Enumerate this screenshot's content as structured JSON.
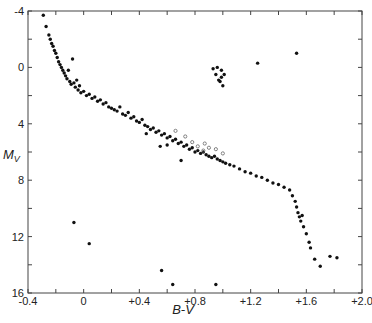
{
  "chart_data": {
    "type": "scatter",
    "title": "",
    "xlabel": "B-V",
    "ylabel": "M_V",
    "xlim": [
      -0.4,
      2.0
    ],
    "ylim": [
      16,
      -4
    ],
    "y_inverted": true,
    "grid": false,
    "legend": null,
    "x_ticks": [
      "-0.4",
      "0",
      "+0.4",
      "+0.8",
      "+1.2",
      "+1.6",
      "+2.0"
    ],
    "x_tick_values": [
      -0.4,
      0,
      0.4,
      0.8,
      1.2,
      1.6,
      2.0
    ],
    "y_ticks": [
      "-4",
      "0",
      "4",
      "8",
      "12",
      "16"
    ],
    "y_tick_values": [
      -4,
      0,
      4,
      8,
      12,
      16
    ],
    "series": [
      {
        "name": "main sequence and giants (filled)",
        "marker": "filled-circle",
        "points": [
          [
            -0.29,
            -3.7
          ],
          [
            -0.27,
            -2.9
          ],
          [
            -0.25,
            -2.3
          ],
          [
            -0.24,
            -2.0
          ],
          [
            -0.23,
            -1.7
          ],
          [
            -0.22,
            -1.5
          ],
          [
            -0.21,
            -1.2
          ],
          [
            -0.2,
            -1.0
          ],
          [
            -0.19,
            -0.7
          ],
          [
            -0.18,
            -0.4
          ],
          [
            -0.17,
            -0.2
          ],
          [
            -0.16,
            0.0
          ],
          [
            -0.15,
            0.2
          ],
          [
            -0.14,
            0.4
          ],
          [
            -0.13,
            0.6
          ],
          [
            -0.12,
            0.8
          ],
          [
            -0.11,
            0.2
          ],
          [
            -0.1,
            1.0
          ],
          [
            -0.09,
            1.2
          ],
          [
            -0.08,
            -0.6
          ],
          [
            -0.07,
            1.1
          ],
          [
            -0.06,
            1.4
          ],
          [
            -0.05,
            0.9
          ],
          [
            -0.04,
            1.6
          ],
          [
            -0.03,
            1.3
          ],
          [
            -0.02,
            1.8
          ],
          [
            0.0,
            1.7
          ],
          [
            0.02,
            2.0
          ],
          [
            0.04,
            1.9
          ],
          [
            0.06,
            2.2
          ],
          [
            0.08,
            2.1
          ],
          [
            0.1,
            2.4
          ],
          [
            0.12,
            2.3
          ],
          [
            0.14,
            2.6
          ],
          [
            0.16,
            2.5
          ],
          [
            0.18,
            2.8
          ],
          [
            0.2,
            2.9
          ],
          [
            0.22,
            3.0
          ],
          [
            0.24,
            3.1
          ],
          [
            0.26,
            2.8
          ],
          [
            0.28,
            3.3
          ],
          [
            0.3,
            3.4
          ],
          [
            0.32,
            3.2
          ],
          [
            0.34,
            3.6
          ],
          [
            0.36,
            3.5
          ],
          [
            0.38,
            3.8
          ],
          [
            0.4,
            3.9
          ],
          [
            0.42,
            3.7
          ],
          [
            0.44,
            4.1
          ],
          [
            0.46,
            4.2
          ],
          [
            0.48,
            4.4
          ],
          [
            0.5,
            4.3
          ],
          [
            0.52,
            4.6
          ],
          [
            0.54,
            4.5
          ],
          [
            0.56,
            4.8
          ],
          [
            0.58,
            4.7
          ],
          [
            0.6,
            5.0
          ],
          [
            0.62,
            4.9
          ],
          [
            0.64,
            5.2
          ],
          [
            0.66,
            5.1
          ],
          [
            0.68,
            5.4
          ],
          [
            0.7,
            5.3
          ],
          [
            0.72,
            5.6
          ],
          [
            0.74,
            5.5
          ],
          [
            0.76,
            5.8
          ],
          [
            0.78,
            5.7
          ],
          [
            0.8,
            6.0
          ],
          [
            0.82,
            5.9
          ],
          [
            0.84,
            6.1
          ],
          [
            0.86,
            6.0
          ],
          [
            0.88,
            6.2
          ],
          [
            0.9,
            6.3
          ],
          [
            0.92,
            6.4
          ],
          [
            0.94,
            6.3
          ],
          [
            0.96,
            6.5
          ],
          [
            0.98,
            6.6
          ],
          [
            1.0,
            6.7
          ],
          [
            1.02,
            6.8
          ],
          [
            1.05,
            6.9
          ],
          [
            1.08,
            7.0
          ],
          [
            1.12,
            7.2
          ],
          [
            1.16,
            7.4
          ],
          [
            1.2,
            7.5
          ],
          [
            1.24,
            7.7
          ],
          [
            1.28,
            7.8
          ],
          [
            1.32,
            8.0
          ],
          [
            1.36,
            8.2
          ],
          [
            1.4,
            8.3
          ],
          [
            1.44,
            8.5
          ],
          [
            1.48,
            8.7
          ],
          [
            1.5,
            9.1
          ],
          [
            1.52,
            9.5
          ],
          [
            1.53,
            9.9
          ],
          [
            1.54,
            10.3
          ],
          [
            1.55,
            10.6
          ],
          [
            1.56,
            10.9
          ],
          [
            1.57,
            10.5
          ],
          [
            1.58,
            11.3
          ],
          [
            1.6,
            11.8
          ],
          [
            1.62,
            12.4
          ],
          [
            1.63,
            12.8
          ],
          [
            1.66,
            13.6
          ],
          [
            1.7,
            14.1
          ],
          [
            1.77,
            13.4
          ],
          [
            1.82,
            13.5
          ],
          [
            0.6,
            5.5
          ],
          [
            0.7,
            6.6
          ],
          [
            0.45,
            4.7
          ],
          [
            0.55,
            5.6
          ]
        ]
      },
      {
        "name": "giants clump",
        "marker": "filled-circle",
        "points": [
          [
            0.96,
            0.0
          ],
          [
            0.99,
            0.2
          ],
          [
            0.93,
            0.1
          ],
          [
            0.95,
            0.5
          ],
          [
            1.01,
            0.5
          ],
          [
            0.99,
            0.7
          ],
          [
            0.97,
            0.9
          ],
          [
            0.98,
            1.0
          ],
          [
            1.0,
            1.3
          ],
          [
            1.25,
            -0.3
          ],
          [
            1.53,
            -1.0
          ]
        ]
      },
      {
        "name": "white dwarfs / subdwarfs",
        "marker": "filled-circle",
        "points": [
          [
            -0.07,
            11.0
          ],
          [
            0.04,
            12.5
          ],
          [
            0.56,
            14.4
          ],
          [
            0.64,
            15.4
          ],
          [
            0.95,
            15.4
          ]
        ]
      },
      {
        "name": "open circles",
        "marker": "open-circle",
        "points": [
          [
            0.66,
            4.5
          ],
          [
            0.73,
            4.9
          ],
          [
            0.78,
            5.3
          ],
          [
            0.82,
            5.6
          ],
          [
            0.86,
            5.9
          ],
          [
            0.9,
            5.7
          ],
          [
            0.95,
            5.8
          ],
          [
            1.0,
            6.1
          ],
          [
            0.87,
            5.4
          ]
        ]
      }
    ]
  }
}
